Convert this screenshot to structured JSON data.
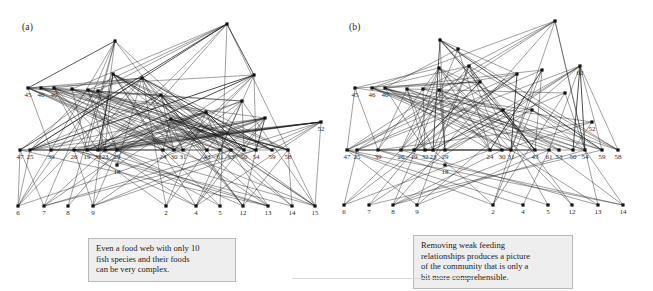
{
  "figure": {
    "background": "#ffffff",
    "ink_color": "#1b1b1b",
    "callout_bg": "#eeeeee",
    "callout_border": "#b9b9b9",
    "width": 653,
    "height": 291
  },
  "panels": [
    {
      "key": "a",
      "label": "(a)",
      "callout": {
        "lines": [
          "Even a food web with only 10",
          "fish species and their foods",
          "can be very complex."
        ]
      },
      "tiers": {
        "apex": [
          {
            "id": "apex1",
            "label": "",
            "x": 115,
            "y": 41
          },
          {
            "id": "apex2",
            "label": "",
            "x": 227,
            "y": 24
          }
        ],
        "upper": [
          {
            "id": "u1",
            "label": "",
            "x": 113,
            "y": 74
          },
          {
            "id": "u2",
            "label": "",
            "x": 142,
            "y": 78
          },
          {
            "id": "u3",
            "label": "",
            "x": 161,
            "y": 95
          },
          {
            "id": "u4",
            "label": "",
            "x": 254,
            "y": 75
          },
          {
            "id": "u5",
            "label": "",
            "x": 242,
            "y": 101
          },
          {
            "id": "u6",
            "label": "",
            "x": 171,
            "y": 119
          },
          {
            "id": "u7",
            "label": "",
            "x": 206,
            "y": 112
          },
          {
            "id": "u8",
            "label": "",
            "x": 265,
            "y": 118
          },
          {
            "id": "u9",
            "label": "",
            "x": 321,
            "y": 122,
            "label_text": "52"
          }
        ],
        "left_row": [
          {
            "id": "l1",
            "label": "45",
            "x": 28,
            "y": 88
          },
          {
            "id": "l2",
            "label": "46",
            "x": 41,
            "y": 88
          },
          {
            "id": "l3",
            "label": "40",
            "x": 54,
            "y": 88
          },
          {
            "id": "l4",
            "label": "",
            "x": 72,
            "y": 89
          },
          {
            "id": "l5",
            "label": "",
            "x": 88,
            "y": 90
          },
          {
            "id": "l6",
            "label": "",
            "x": 98,
            "y": 91
          }
        ],
        "middle_row": [
          {
            "id": "m1",
            "label": "47",
            "x": 20,
            "y": 150
          },
          {
            "id": "m2",
            "label": "25",
            "x": 30,
            "y": 150
          },
          {
            "id": "m3",
            "label": "39",
            "x": 51,
            "y": 150
          },
          {
            "id": "m4",
            "label": "26",
            "x": 74,
            "y": 150
          },
          {
            "id": "m5",
            "label": "19",
            "x": 87,
            "y": 150
          },
          {
            "id": "m6",
            "label": "32",
            "x": 98,
            "y": 150
          },
          {
            "id": "m7",
            "label": "23",
            "x": 105,
            "y": 150
          },
          {
            "id": "m8",
            "label": "29",
            "x": 117,
            "y": 150
          },
          {
            "id": "m9",
            "label": "24",
            "x": 163,
            "y": 150
          },
          {
            "id": "m10",
            "label": "30",
            "x": 174,
            "y": 150
          },
          {
            "id": "m11",
            "label": "31",
            "x": 183,
            "y": 150
          },
          {
            "id": "m12",
            "label": "43",
            "x": 207,
            "y": 150
          },
          {
            "id": "m13",
            "label": "61",
            "x": 220,
            "y": 150
          },
          {
            "id": "m14",
            "label": "53",
            "x": 231,
            "y": 150
          },
          {
            "id": "m15",
            "label": "50",
            "x": 244,
            "y": 150
          },
          {
            "id": "m16",
            "label": "54",
            "x": 256,
            "y": 150
          },
          {
            "id": "m17",
            "label": "59",
            "x": 272,
            "y": 150
          },
          {
            "id": "m18",
            "label": "58",
            "x": 288,
            "y": 150
          }
        ],
        "isolated": [
          {
            "id": "n18",
            "label": "18",
            "x": 117,
            "y": 165
          }
        ],
        "bottom_row": [
          {
            "id": "b6",
            "label": "6",
            "x": 18,
            "y": 206
          },
          {
            "id": "b7",
            "label": "7",
            "x": 44,
            "y": 206
          },
          {
            "id": "b8",
            "label": "8",
            "x": 68,
            "y": 206
          },
          {
            "id": "b9",
            "label": "9",
            "x": 93,
            "y": 206
          },
          {
            "id": "b2",
            "label": "2",
            "x": 166,
            "y": 206
          },
          {
            "id": "b4",
            "label": "4",
            "x": 196,
            "y": 206
          },
          {
            "id": "b5",
            "label": "5",
            "x": 220,
            "y": 206
          },
          {
            "id": "b12",
            "label": "12",
            "x": 243,
            "y": 206
          },
          {
            "id": "b13",
            "label": "13",
            "x": 268,
            "y": 206
          },
          {
            "id": "b14",
            "label": "14",
            "x": 292,
            "y": 206
          },
          {
            "id": "b15",
            "label": "15",
            "x": 315,
            "y": 206
          }
        ]
      }
    },
    {
      "key": "b",
      "label": "(b)",
      "callout": {
        "lines": [
          "Removing weak feeding",
          "relationships produces a picture",
          "of the community that is only a",
          "bit more comprehensible."
        ]
      },
      "tiers": {
        "apex": [
          {
            "id": "apex1",
            "label": "",
            "x": 113,
            "y": 40
          },
          {
            "id": "apex2",
            "label": "",
            "x": 228,
            "y": 21
          }
        ],
        "upper": [
          {
            "id": "u1",
            "label": "",
            "x": 131,
            "y": 49
          },
          {
            "id": "u2",
            "label": "",
            "x": 112,
            "y": 68
          },
          {
            "id": "u3",
            "label": "",
            "x": 142,
            "y": 66
          },
          {
            "id": "u4",
            "label": "",
            "x": 153,
            "y": 82
          },
          {
            "id": "u5",
            "label": "",
            "x": 190,
            "y": 74
          },
          {
            "id": "u6",
            "label": "",
            "x": 215,
            "y": 70
          },
          {
            "id": "u7",
            "label": "",
            "x": 253,
            "y": 66,
            "label_text": "62"
          },
          {
            "id": "u8",
            "label": "",
            "x": 238,
            "y": 93
          },
          {
            "id": "u9",
            "label": "",
            "x": 176,
            "y": 110
          },
          {
            "id": "u10",
            "label": "",
            "x": 205,
            "y": 110
          },
          {
            "id": "u11",
            "label": "",
            "x": 265,
            "y": 122,
            "label_text": "52"
          }
        ],
        "left_row": [
          {
            "id": "l1",
            "label": "45",
            "x": 28,
            "y": 88
          },
          {
            "id": "l2",
            "label": "46",
            "x": 45,
            "y": 88
          },
          {
            "id": "l3",
            "label": "40",
            "x": 58,
            "y": 88
          },
          {
            "id": "l4",
            "label": "",
            "x": 80,
            "y": 89
          },
          {
            "id": "l5",
            "label": "",
            "x": 96,
            "y": 89
          },
          {
            "id": "l6",
            "label": "",
            "x": 112,
            "y": 90
          }
        ],
        "middle_row": [
          {
            "id": "m1",
            "label": "47",
            "x": 20,
            "y": 150
          },
          {
            "id": "m2",
            "label": "25",
            "x": 30,
            "y": 150
          },
          {
            "id": "m3",
            "label": "39",
            "x": 51,
            "y": 150
          },
          {
            "id": "m4",
            "label": "26",
            "x": 74,
            "y": 150
          },
          {
            "id": "m5",
            "label": "19",
            "x": 87,
            "y": 150
          },
          {
            "id": "m6",
            "label": "32",
            "x": 98,
            "y": 150
          },
          {
            "id": "m7",
            "label": "23",
            "x": 106,
            "y": 150
          },
          {
            "id": "m8",
            "label": "29",
            "x": 118,
            "y": 150
          },
          {
            "id": "m9",
            "label": "24",
            "x": 163,
            "y": 150
          },
          {
            "id": "m10",
            "label": "30",
            "x": 175,
            "y": 150
          },
          {
            "id": "m11",
            "label": "31",
            "x": 184,
            "y": 150
          },
          {
            "id": "m12",
            "label": "43",
            "x": 208,
            "y": 150
          },
          {
            "id": "m13",
            "label": "61",
            "x": 222,
            "y": 150
          },
          {
            "id": "m14",
            "label": "53",
            "x": 232,
            "y": 150
          },
          {
            "id": "m15",
            "label": "50",
            "x": 246,
            "y": 150
          },
          {
            "id": "m16",
            "label": "54",
            "x": 258,
            "y": 150
          },
          {
            "id": "m17",
            "label": "59",
            "x": 275,
            "y": 150
          },
          {
            "id": "m18",
            "label": "58",
            "x": 291,
            "y": 150
          }
        ],
        "isolated": [
          {
            "id": "n18",
            "label": "18",
            "x": 118,
            "y": 165
          }
        ],
        "bottom_row": [
          {
            "id": "b6",
            "label": "6",
            "x": 17,
            "y": 205
          },
          {
            "id": "b7",
            "label": "7",
            "x": 42,
            "y": 205
          },
          {
            "id": "b8",
            "label": "8",
            "x": 66,
            "y": 205
          },
          {
            "id": "b9",
            "label": "9",
            "x": 90,
            "y": 205
          },
          {
            "id": "b2",
            "label": "2",
            "x": 166,
            "y": 205
          },
          {
            "id": "b4",
            "label": "4",
            "x": 196,
            "y": 205
          },
          {
            "id": "b5",
            "label": "5",
            "x": 221,
            "y": 205
          },
          {
            "id": "b12",
            "label": "12",
            "x": 245,
            "y": 205
          },
          {
            "id": "b13",
            "label": "13",
            "x": 271,
            "y": 205
          },
          {
            "id": "b14",
            "label": "14",
            "x": 296,
            "y": 205
          }
        ]
      }
    }
  ]
}
